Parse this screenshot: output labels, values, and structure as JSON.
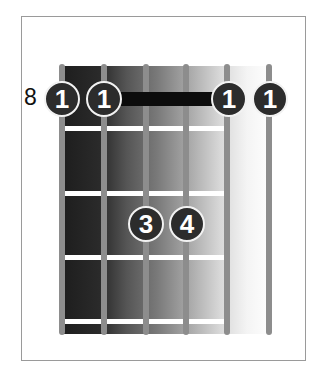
{
  "diagram": {
    "type": "guitar-chord-chart",
    "start_fret_label": "8",
    "strings": 6,
    "frets_shown": 4,
    "barre": {
      "fret": 1,
      "from_string": 1,
      "to_string": 6,
      "finger": "1"
    },
    "fingers": [
      {
        "string": 1,
        "fret": 1,
        "label": "1"
      },
      {
        "string": 2,
        "fret": 1,
        "label": "1"
      },
      {
        "string": 5,
        "fret": 1,
        "label": "1"
      },
      {
        "string": 6,
        "fret": 1,
        "label": "1"
      },
      {
        "string": 3,
        "fret": 3,
        "label": "3"
      },
      {
        "string": 4,
        "fret": 3,
        "label": "4"
      }
    ],
    "colors": {
      "dot_fill": "#2c2c2c",
      "dot_outline": "#f2f2f2",
      "string": "#8d8d8d",
      "fret": "#ffffff",
      "barre": "#0c0c0c",
      "frame": "#9a9a9a"
    }
  }
}
